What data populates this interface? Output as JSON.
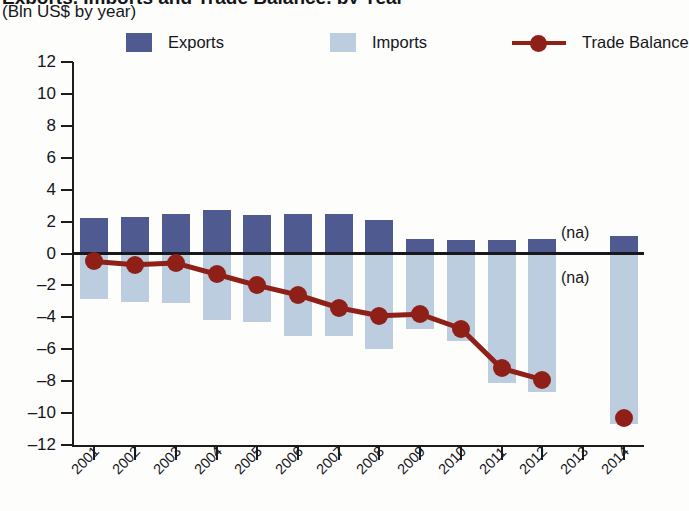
{
  "header": {
    "title": "Exports, Imports and Trade Balance, by Year",
    "subtitle": "(Bln US$ by year)"
  },
  "legend": {
    "items": [
      {
        "label": "Exports",
        "marker": "square-swatch",
        "color": "#4f5a90"
      },
      {
        "label": "Imports",
        "marker": "square-swatch",
        "color": "#bdcde0"
      },
      {
        "label": "Trade Balance",
        "marker": "line-with-dot",
        "color": "#8f2018"
      }
    ]
  },
  "annotations": [
    {
      "text": "(na)",
      "year": "2013",
      "where": "above-zero"
    },
    {
      "text": "(na)",
      "year": "2013",
      "where": "below-zero"
    }
  ],
  "axes": {
    "y_ticks": [
      "12",
      "10",
      "8",
      "6",
      "4",
      "2",
      "0",
      "-2",
      "-4",
      "-6",
      "-8",
      "-10",
      "-12"
    ],
    "x_ticks": [
      "2001",
      "2002",
      "2003",
      "2004",
      "2005",
      "2006",
      "2007",
      "2008",
      "2009",
      "2010",
      "2011",
      "2012",
      "2013",
      "2014"
    ]
  },
  "chart_data": {
    "type": "bar",
    "title": "Exports, Imports and Trade Balance, by Year",
    "subtitle": "(Bln US$ by year)",
    "xlabel": "",
    "ylabel": "Bln US$",
    "ylim": [
      -12,
      12
    ],
    "ytick_step": 2,
    "grid": false,
    "legend_position": "top",
    "categories": [
      "2001",
      "2002",
      "2003",
      "2004",
      "2005",
      "2006",
      "2007",
      "2008",
      "2009",
      "2010",
      "2011",
      "2012",
      "2013",
      "2014"
    ],
    "series": [
      {
        "name": "Exports",
        "type": "bar",
        "color": "#4f5a90",
        "values": [
          2.2,
          2.3,
          2.45,
          2.75,
          2.4,
          2.45,
          2.45,
          2.1,
          0.9,
          0.85,
          0.85,
          0.9,
          null,
          1.1
        ]
      },
      {
        "name": "Imports",
        "type": "bar",
        "color": "#bdcde0",
        "values": [
          -2.85,
          -3.05,
          -3.1,
          -4.15,
          -4.3,
          -5.2,
          -5.2,
          -6.0,
          -4.7,
          -5.5,
          -8.1,
          -8.7,
          null,
          -10.7
        ]
      },
      {
        "name": "Trade Balance",
        "type": "line",
        "color": "#8f2018",
        "values": [
          -0.5,
          -0.7,
          -0.6,
          -1.3,
          -2.0,
          -2.6,
          -3.4,
          -3.9,
          -3.8,
          -4.7,
          -7.2,
          -7.9,
          null,
          -10.3
        ]
      }
    ]
  }
}
